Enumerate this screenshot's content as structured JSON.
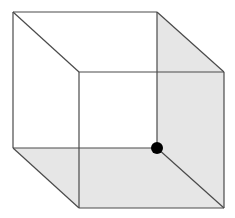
{
  "diagram": {
    "type": "necker-cube",
    "colors": {
      "background": "#ffffff",
      "stroke": "#4a4a4a",
      "shade": "#e6e6e6",
      "dot": "#000000"
    },
    "back_square": {
      "x": 13,
      "y": 12,
      "size": 144
    },
    "front_square": {
      "x": 79,
      "y": 72,
      "width": 145,
      "height": 136
    },
    "vertices": {
      "back_top_left": [
        13,
        12
      ],
      "back_top_right": [
        157,
        12
      ],
      "back_bottom_left": [
        13,
        148
      ],
      "back_bottom_right": [
        157,
        148
      ],
      "front_top_left": [
        79,
        72
      ],
      "front_top_right": [
        224,
        72
      ],
      "front_bottom_left": [
        79,
        208
      ],
      "front_bottom_right": [
        224,
        208
      ]
    },
    "shaded_faces": [
      "right-face",
      "bottom-face"
    ],
    "marker": {
      "cx": 157,
      "cy": 148,
      "r": 6
    }
  }
}
